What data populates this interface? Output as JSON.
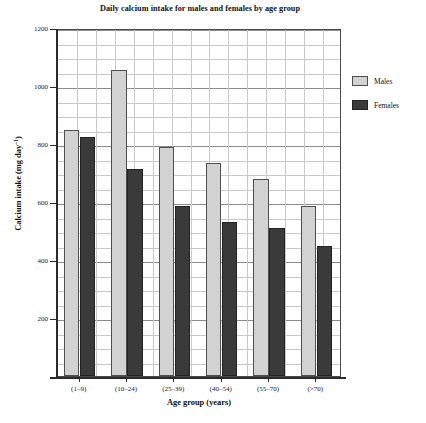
{
  "chart_data": {
    "type": "bar",
    "title": "Daily calcium intake for males and females by age group",
    "xlabel": "Age group (years)",
    "ylabel": "Calcium intake (mg day⁻¹)",
    "ylabel_base": "Calcium intake (mg day",
    "ylabel_sup": "–1",
    "ylabel_tail": ")",
    "categories": [
      "(1–9)",
      "(10–24)",
      "(25–39)",
      "(40–54)",
      "(55–70)",
      "(>70)"
    ],
    "series": [
      {
        "name": "Males",
        "color": "#d2d2d2",
        "values": [
          850,
          1055,
          790,
          735,
          680,
          585
        ]
      },
      {
        "name": "Females",
        "color": "#3a3a3a",
        "values": [
          825,
          715,
          585,
          530,
          510,
          450
        ]
      }
    ],
    "ylim": [
      0,
      1200
    ],
    "y_ticks": [
      1200,
      1000,
      800,
      600,
      400,
      200
    ],
    "y_tick_labels": [
      "1200",
      "1000",
      "800",
      "600",
      "400",
      "200"
    ],
    "y_minor_step": 50,
    "grid": true,
    "legend_position": "right",
    "legend_entries": [
      "Males",
      "Females"
    ]
  }
}
